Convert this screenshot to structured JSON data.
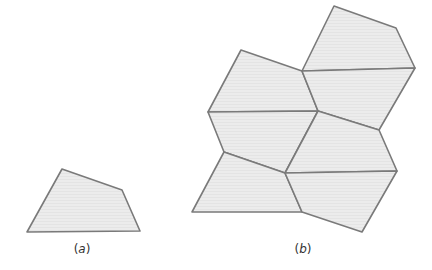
{
  "figure": {
    "panels": [
      {
        "id": "a",
        "label": "(a)",
        "label_pos": [
          82,
          242
        ],
        "description": "Single irregular quadrilateral",
        "tiles": [
          [
            [
              27,
              232
            ],
            [
              62,
              169
            ],
            [
              122,
              190
            ],
            [
              140,
              231
            ]
          ]
        ]
      },
      {
        "id": "b",
        "label": "(b)",
        "label_pos": [
          303,
          242
        ],
        "description": "Tiling of congruent quadrilaterals",
        "tiles": [
          [
            [
              302,
              71
            ],
            [
              334,
              6
            ],
            [
              396,
              28
            ],
            [
              415,
              68
            ]
          ],
          [
            [
              208,
              112
            ],
            [
              241,
              50
            ],
            [
              302,
              71
            ],
            [
              318,
              111
            ]
          ],
          [
            [
              302,
              71
            ],
            [
              415,
              68
            ],
            [
              379,
              130
            ],
            [
              318,
              111
            ]
          ],
          [
            [
              208,
              112
            ],
            [
              318,
              111
            ],
            [
              285,
              173
            ],
            [
              224,
              152
            ]
          ],
          [
            [
              318,
              111
            ],
            [
              379,
              130
            ],
            [
              397,
              171
            ],
            [
              285,
              173
            ]
          ],
          [
            [
              192,
              212
            ],
            [
              224,
              152
            ],
            [
              285,
              173
            ],
            [
              302,
              212
            ]
          ],
          [
            [
              285,
              173
            ],
            [
              397,
              171
            ],
            [
              362,
              232
            ],
            [
              302,
              212
            ]
          ]
        ]
      }
    ],
    "colors": {
      "fill": "#ececec",
      "stroke": "#7a7a7a"
    }
  }
}
